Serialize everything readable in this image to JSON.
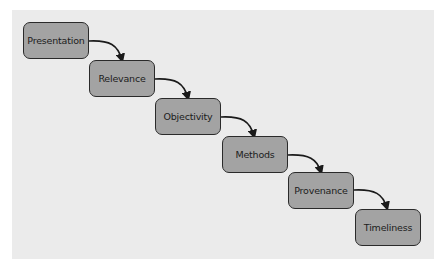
{
  "diagram": {
    "type": "staircase-flow",
    "colors": {
      "background": "#ebebeb",
      "box_fill": "#a3a3a3",
      "box_border": "#2a2a2a",
      "arrow": "#1a1a1a"
    },
    "steps": [
      {
        "label": "Presentation"
      },
      {
        "label": "Relevance"
      },
      {
        "label": "Objectivity"
      },
      {
        "label": "Methods"
      },
      {
        "label": "Provenance"
      },
      {
        "label": "Timeliness"
      }
    ],
    "connections": [
      {
        "from": "Presentation",
        "to": "Relevance"
      },
      {
        "from": "Relevance",
        "to": "Objectivity"
      },
      {
        "from": "Objectivity",
        "to": "Methods"
      },
      {
        "from": "Methods",
        "to": "Provenance"
      },
      {
        "from": "Provenance",
        "to": "Timeliness"
      }
    ]
  }
}
